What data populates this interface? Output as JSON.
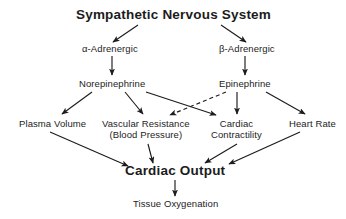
{
  "diagram": {
    "title": "Sympathetic Nervous System",
    "colors": {
      "background": "#ffffff",
      "text": "#1c1c1c",
      "edge": "#1c1c1c"
    },
    "nodes": [
      {
        "id": "sns",
        "label": "Sympathetic Nervous System",
        "style": "title",
        "x": 173,
        "y": 14
      },
      {
        "id": "alpha-adrenergic",
        "label": "α-Adrenergic",
        "style": "plain",
        "x": 110,
        "y": 48
      },
      {
        "id": "beta-adrenergic",
        "label": "β-Adrenergic",
        "style": "plain",
        "x": 247,
        "y": 48
      },
      {
        "id": "norepinephrine",
        "label": "Norepinephrine",
        "style": "plain",
        "x": 112,
        "y": 83
      },
      {
        "id": "epinephrine",
        "label": "Epinephrine",
        "style": "plain",
        "x": 245,
        "y": 83
      },
      {
        "id": "plasma-volume",
        "label": "Plasma Volume",
        "style": "plain",
        "x": 52,
        "y": 123
      },
      {
        "id": "vascular-resistance",
        "label": "Vascular Resistance\n(Blood Pressure)",
        "style": "plain-2line",
        "x": 146,
        "y": 129
      },
      {
        "id": "cardiac-contractility",
        "label": "Cardiac\nContractility",
        "style": "plain-2line",
        "x": 236,
        "y": 129
      },
      {
        "id": "heart-rate",
        "label": "Heart Rate",
        "style": "plain",
        "x": 312,
        "y": 123
      },
      {
        "id": "cardiac-output",
        "label": "Cardiac Output",
        "style": "major",
        "x": 175,
        "y": 170
      },
      {
        "id": "tissue-oxygenation",
        "label": "Tissue Oxygenation",
        "style": "plain",
        "x": 175,
        "y": 203
      }
    ],
    "edges": [
      {
        "id": "sns-to-alpha",
        "from": "sns",
        "to": "alpha-adrenergic",
        "dashed": false,
        "x1": 138,
        "y1": 25,
        "x2": 113,
        "y2": 42
      },
      {
        "id": "sns-to-beta",
        "from": "sns",
        "to": "beta-adrenergic",
        "dashed": false,
        "x1": 221,
        "y1": 25,
        "x2": 246,
        "y2": 42
      },
      {
        "id": "alpha-to-norepinephrine",
        "from": "alpha-adrenergic",
        "to": "norepinephrine",
        "dashed": false,
        "x1": 112,
        "y1": 56,
        "x2": 112,
        "y2": 75
      },
      {
        "id": "beta-to-epinephrine",
        "from": "beta-adrenergic",
        "to": "epinephrine",
        "dashed": false,
        "x1": 245,
        "y1": 56,
        "x2": 245,
        "y2": 75
      },
      {
        "id": "norepinephrine-to-plasma-volume",
        "from": "norepinephrine",
        "to": "plasma-volume",
        "dashed": false,
        "x1": 92,
        "y1": 92,
        "x2": 62,
        "y2": 114
      },
      {
        "id": "norepinephrine-to-vascular-resistance",
        "from": "norepinephrine",
        "to": "vascular-resistance",
        "dashed": false,
        "x1": 125,
        "y1": 92,
        "x2": 143,
        "y2": 114
      },
      {
        "id": "norepinephrine-to-cardiac-contractility",
        "from": "norepinephrine",
        "to": "cardiac-contractility",
        "dashed": false,
        "x1": 146,
        "y1": 92,
        "x2": 216,
        "y2": 115
      },
      {
        "id": "epinephrine-to-vascular-resistance",
        "from": "epinephrine",
        "to": "vascular-resistance",
        "dashed": true,
        "x1": 226,
        "y1": 92,
        "x2": 170,
        "y2": 115
      },
      {
        "id": "epinephrine-to-cardiac-contractility",
        "from": "epinephrine",
        "to": "cardiac-contractility",
        "dashed": false,
        "x1": 237,
        "y1": 92,
        "x2": 237,
        "y2": 114
      },
      {
        "id": "epinephrine-to-heart-rate",
        "from": "epinephrine",
        "to": "heart-rate",
        "dashed": false,
        "x1": 266,
        "y1": 92,
        "x2": 305,
        "y2": 114
      },
      {
        "id": "plasma-volume-to-cardiac-output",
        "from": "plasma-volume",
        "to": "cardiac-output",
        "dashed": false,
        "x1": 50,
        "y1": 132,
        "x2": 128,
        "y2": 166
      },
      {
        "id": "vascular-resistance-to-cardiac-output",
        "from": "vascular-resistance",
        "to": "cardiac-output",
        "dashed": false,
        "x1": 148,
        "y1": 144,
        "x2": 153,
        "y2": 163
      },
      {
        "id": "cardiac-contractility-to-cardiac-output",
        "from": "cardiac-contractility",
        "to": "cardiac-output",
        "dashed": false,
        "x1": 237,
        "y1": 144,
        "x2": 205,
        "y2": 163
      },
      {
        "id": "heart-rate-to-cardiac-output",
        "from": "heart-rate",
        "to": "cardiac-output",
        "dashed": false,
        "x1": 300,
        "y1": 132,
        "x2": 229,
        "y2": 164
      },
      {
        "id": "cardiac-output-to-tissue-oxygenation",
        "from": "cardiac-output",
        "to": "tissue-oxygenation",
        "dashed": false,
        "x1": 175,
        "y1": 180,
        "x2": 175,
        "y2": 196
      }
    ]
  }
}
